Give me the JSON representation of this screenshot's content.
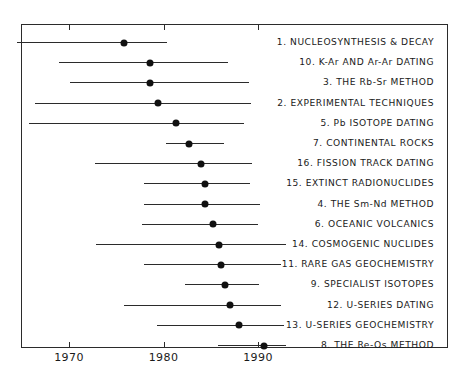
{
  "chart_data": {
    "type": "scatter",
    "title": "",
    "subtitle": "",
    "xlabel": "",
    "ylabel": "",
    "xlim": [
      1964.5,
      1994.5
    ],
    "grid": false,
    "legend_position": "right-labels",
    "tick_labels": [
      "1970",
      "1980",
      "1990"
    ],
    "tick_values": [
      1970,
      1980,
      1990
    ],
    "series_note": "Each row: horizontal range bar with a median dot (year of publication span and median year)",
    "rows": [
      {
        "label": "1. NUCLEOSYNTHESIS & DECAY",
        "number": 1,
        "name": "NUCLEOSYNTHESIS & DECAY",
        "start": 1964.5,
        "end": 1980.4,
        "median": 1975.8
      },
      {
        "label": "10. K-Ar AND Ar-Ar DATING",
        "number": 10,
        "name": "K-Ar AND Ar-Ar DATING",
        "start": 1968.9,
        "end": 1986.8,
        "median": 1978.6
      },
      {
        "label": "3. THE Rb-Sr METHOD",
        "number": 3,
        "name": "THE Rb-Sr METHOD",
        "start": 1970.1,
        "end": 1989.1,
        "median": 1978.6
      },
      {
        "label": "2. EXPERIMENTAL TECHNIQUES",
        "number": 2,
        "name": "EXPERIMENTAL TECHNIQUES",
        "start": 1966.4,
        "end": 1989.3,
        "median": 1979.4
      },
      {
        "label": "5. Pb ISOTOPE DATING",
        "number": 5,
        "name": "Pb ISOTOPE DATING",
        "start": 1965.8,
        "end": 1988.5,
        "median": 1981.3
      },
      {
        "label": "7. CONTINENTAL ROCKS",
        "number": 7,
        "name": "CONTINENTAL ROCKS",
        "start": 1980.3,
        "end": 1986.4,
        "median": 1982.7
      },
      {
        "label": "16. FISSION TRACK DATING",
        "number": 16,
        "name": "FISSION TRACK DATING",
        "start": 1972.7,
        "end": 1989.4,
        "median": 1984.0
      },
      {
        "label": "15. EXTINCT RADIONUCLIDES",
        "number": 15,
        "name": "EXTINCT RADIONUCLIDES",
        "start": 1977.9,
        "end": 1989.2,
        "median": 1984.4
      },
      {
        "label": "4. THE Sm-Nd METHOD",
        "number": 4,
        "name": "THE Sm-Nd METHOD",
        "start": 1977.9,
        "end": 1990.2,
        "median": 1984.4
      },
      {
        "label": "6. OCEANIC VOLCANICS",
        "number": 6,
        "name": "OCEANIC VOLCANICS",
        "start": 1977.7,
        "end": 1990.0,
        "median": 1985.2
      },
      {
        "label": "14. COSMOGENIC NUCLIDES",
        "number": 14,
        "name": "COSMOGENIC NUCLIDES",
        "start": 1972.9,
        "end": 1993.0,
        "median": 1985.9
      },
      {
        "label": "11. RARE GAS GEOCHEMISTRY",
        "number": 11,
        "name": "RARE GAS GEOCHEMISTRY",
        "start": 1977.9,
        "end": 1992.4,
        "median": 1986.1
      },
      {
        "label": "9. SPECIALIST ISOTOPES",
        "number": 9,
        "name": "SPECIALIST ISOTOPES",
        "start": 1982.3,
        "end": 1990.1,
        "median": 1986.5
      },
      {
        "label": "12. U-SERIES DATING",
        "number": 12,
        "name": "U-SERIES DATING",
        "start": 1975.8,
        "end": 1992.4,
        "median": 1987.0
      },
      {
        "label": "13. U-SERIES GEOCHEMISTRY",
        "number": 13,
        "name": "U-SERIES GEOCHEMISTRY",
        "start": 1979.3,
        "end": 1992.7,
        "median": 1988.0
      },
      {
        "label": "8. THE Re-Os METHOD",
        "number": 8,
        "name": "THE Re-Os METHOD",
        "start": 1985.8,
        "end": 1993.0,
        "median": 1990.6
      }
    ]
  }
}
